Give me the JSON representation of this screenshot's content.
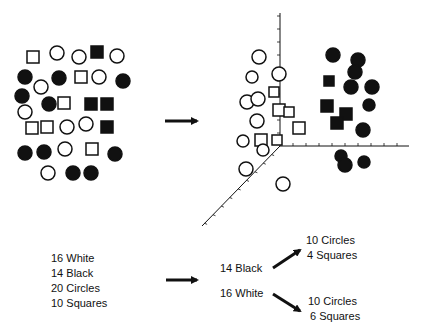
{
  "colors": {
    "ink": "#111111",
    "background": "#ffffff"
  },
  "unsorted": {
    "shapes": [
      {
        "t": "sq",
        "f": "white",
        "x": 33,
        "y": 57
      },
      {
        "t": "ci",
        "f": "white",
        "x": 57,
        "y": 53
      },
      {
        "t": "ci",
        "f": "white",
        "x": 79,
        "y": 57
      },
      {
        "t": "sq",
        "f": "black",
        "x": 97,
        "y": 52
      },
      {
        "t": "ci",
        "f": "white",
        "x": 117,
        "y": 56
      },
      {
        "t": "ci",
        "f": "black",
        "x": 25,
        "y": 77
      },
      {
        "t": "ci",
        "f": "white",
        "x": 41,
        "y": 87
      },
      {
        "t": "ci",
        "f": "black",
        "x": 59,
        "y": 78
      },
      {
        "t": "sq",
        "f": "white",
        "x": 81,
        "y": 77
      },
      {
        "t": "ci",
        "f": "white",
        "x": 99,
        "y": 77
      },
      {
        "t": "ci",
        "f": "black",
        "x": 123,
        "y": 81
      },
      {
        "t": "ci",
        "f": "black",
        "x": 22,
        "y": 96
      },
      {
        "t": "ci",
        "f": "white",
        "x": 25,
        "y": 112
      },
      {
        "t": "ci",
        "f": "black",
        "x": 49,
        "y": 104
      },
      {
        "t": "sq",
        "f": "white",
        "x": 64,
        "y": 103
      },
      {
        "t": "sq",
        "f": "black",
        "x": 91,
        "y": 104
      },
      {
        "t": "sq",
        "f": "black",
        "x": 107,
        "y": 104
      },
      {
        "t": "sq",
        "f": "white",
        "x": 32,
        "y": 128
      },
      {
        "t": "sq",
        "f": "white",
        "x": 47,
        "y": 127
      },
      {
        "t": "ci",
        "f": "white",
        "x": 67,
        "y": 127
      },
      {
        "t": "ci",
        "f": "white",
        "x": 86,
        "y": 124
      },
      {
        "t": "sq",
        "f": "black",
        "x": 107,
        "y": 127
      },
      {
        "t": "ci",
        "f": "black",
        "x": 25,
        "y": 153
      },
      {
        "t": "ci",
        "f": "black",
        "x": 44,
        "y": 152
      },
      {
        "t": "ci",
        "f": "white",
        "x": 65,
        "y": 149
      },
      {
        "t": "sq",
        "f": "white",
        "x": 92,
        "y": 149
      },
      {
        "t": "ci",
        "f": "black",
        "x": 115,
        "y": 154
      },
      {
        "t": "ci",
        "f": "white",
        "x": 48,
        "y": 173
      },
      {
        "t": "ci",
        "f": "black",
        "x": 73,
        "y": 173
      },
      {
        "t": "ci",
        "f": "black",
        "x": 91,
        "y": 173
      }
    ]
  },
  "sorted": {
    "axes": {
      "origin": [
        280,
        146
      ],
      "vertical_end": [
        280,
        13
      ],
      "horizontal_end": [
        409,
        146
      ],
      "diagonal_end": [
        202,
        226
      ]
    },
    "shapes": [
      {
        "t": "ci",
        "f": "white",
        "x": 259,
        "y": 57
      },
      {
        "t": "ci",
        "f": "white",
        "x": 252,
        "y": 77,
        "r": 6
      },
      {
        "t": "ci",
        "f": "white",
        "x": 279,
        "y": 74
      },
      {
        "t": "sq",
        "f": "white",
        "x": 274,
        "y": 92,
        "s": 10
      },
      {
        "t": "ci",
        "f": "white",
        "x": 247,
        "y": 102
      },
      {
        "t": "ci",
        "f": "white",
        "x": 258,
        "y": 99
      },
      {
        "t": "sq",
        "f": "white",
        "x": 279,
        "y": 110
      },
      {
        "t": "sq",
        "f": "white",
        "x": 289,
        "y": 112,
        "s": 10
      },
      {
        "t": "ci",
        "f": "white",
        "x": 257,
        "y": 121
      },
      {
        "t": "sq",
        "f": "white",
        "x": 299,
        "y": 128
      },
      {
        "t": "ci",
        "f": "white",
        "x": 243,
        "y": 141,
        "r": 6
      },
      {
        "t": "sq",
        "f": "white",
        "x": 261,
        "y": 140
      },
      {
        "t": "sq",
        "f": "white",
        "x": 277,
        "y": 140,
        "s": 10
      },
      {
        "t": "ci",
        "f": "white",
        "x": 263,
        "y": 150,
        "r": 6
      },
      {
        "t": "ci",
        "f": "white",
        "x": 246,
        "y": 169
      },
      {
        "t": "ci",
        "f": "white",
        "x": 283,
        "y": 184
      },
      {
        "t": "ci",
        "f": "black",
        "x": 333,
        "y": 55
      },
      {
        "t": "ci",
        "f": "black",
        "x": 358,
        "y": 60
      },
      {
        "t": "ci",
        "f": "black",
        "x": 355,
        "y": 72
      },
      {
        "t": "sq",
        "f": "black",
        "x": 329,
        "y": 81,
        "s": 10
      },
      {
        "t": "ci",
        "f": "black",
        "x": 351,
        "y": 87
      },
      {
        "t": "ci",
        "f": "black",
        "x": 372,
        "y": 87
      },
      {
        "t": "sq",
        "f": "black",
        "x": 327,
        "y": 106
      },
      {
        "t": "ci",
        "f": "black",
        "x": 369,
        "y": 105,
        "r": 6
      },
      {
        "t": "sq",
        "f": "black",
        "x": 346,
        "y": 114
      },
      {
        "t": "sq",
        "f": "black",
        "x": 337,
        "y": 123
      },
      {
        "t": "ci",
        "f": "black",
        "x": 363,
        "y": 130
      },
      {
        "t": "ci",
        "f": "black",
        "x": 341,
        "y": 156,
        "r": 6
      },
      {
        "t": "ci",
        "f": "black",
        "x": 345,
        "y": 165
      },
      {
        "t": "ci",
        "f": "black",
        "x": 364,
        "y": 162,
        "r": 6
      }
    ]
  },
  "arrows": {
    "top": {
      "from": [
        165,
        121
      ],
      "to": [
        197,
        121
      ]
    },
    "bottom": {
      "from": [
        166,
        280
      ],
      "to": [
        197,
        280
      ]
    },
    "to_black": {
      "from": [
        273,
        268
      ],
      "to": [
        300,
        250
      ]
    },
    "to_white": {
      "from": [
        273,
        294
      ],
      "to": [
        300,
        311
      ]
    }
  },
  "summary": {
    "totals": [
      "16 White",
      "14 Black",
      "20 Circles",
      "10 Squares"
    ],
    "black_label": "14 Black",
    "white_label": "16 White",
    "black_breakdown": [
      "10 Circles",
      "4 Squares"
    ],
    "white_breakdown": [
      "10 Circles",
      "6 Squares"
    ]
  }
}
